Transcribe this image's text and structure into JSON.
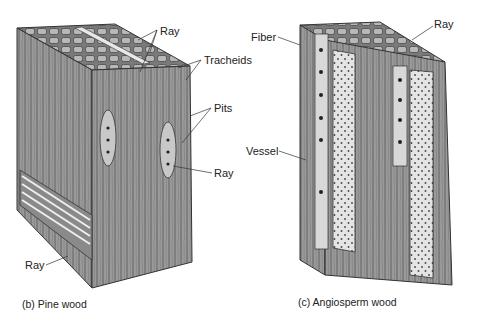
{
  "diagram": {
    "panels": [
      {
        "id": "pine",
        "caption": "(b) Pine wood",
        "labels": {
          "ray_top": "Ray",
          "tracheids": "Tracheids",
          "pits": "Pits",
          "ray_right": "Ray",
          "ray_bottom": "Ray"
        }
      },
      {
        "id": "angiosperm",
        "caption": "(c) Angiosperm wood",
        "labels": {
          "fiber": "Fiber",
          "ray": "Ray",
          "vessel": "Vessel"
        }
      }
    ],
    "colors": {
      "wood_fill": "#9a9a9a",
      "wood_dark": "#6e6e6e",
      "outline": "#333333",
      "vessel_fill": "#e6e6e6"
    }
  }
}
